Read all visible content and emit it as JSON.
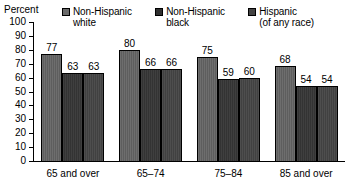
{
  "chart_data": {
    "type": "bar",
    "title": "",
    "ylabel": "Percent",
    "xlabel": "",
    "ylim": [
      0,
      100
    ],
    "yticks": [
      0,
      10,
      20,
      30,
      40,
      50,
      60,
      70,
      80,
      90,
      100
    ],
    "grid": false,
    "legend_position": "top",
    "categories": [
      "65 and over",
      "65–74",
      "75–84",
      "85 and over"
    ],
    "series": [
      {
        "name": "Non-Hispanic white",
        "legend_line1": "Non-Hispanic",
        "legend_line2": "white",
        "color": "#5e5e5e",
        "values": [
          77,
          80,
          75,
          68
        ]
      },
      {
        "name": "Non-Hispanic black",
        "legend_line1": "Non-Hispanic",
        "legend_line2": "black",
        "color": "#333333",
        "values": [
          63,
          66,
          59,
          54
        ]
      },
      {
        "name": "Hispanic (of any race)",
        "legend_line1": "Hispanic",
        "legend_line2": "(of any race)",
        "color": "#414141",
        "values": [
          63,
          66,
          60,
          54
        ]
      }
    ]
  },
  "axis": {
    "y_title": "Percent"
  },
  "legend": {
    "items": [
      {
        "label": "Non-Hispanic\nwhite",
        "swatch_class": "swatch-nhw"
      },
      {
        "label": "Non-Hispanic\nblack",
        "swatch_class": "swatch-nhb"
      },
      {
        "label": "Hispanic\n(of any race)",
        "swatch_class": "swatch-hisp"
      }
    ]
  }
}
